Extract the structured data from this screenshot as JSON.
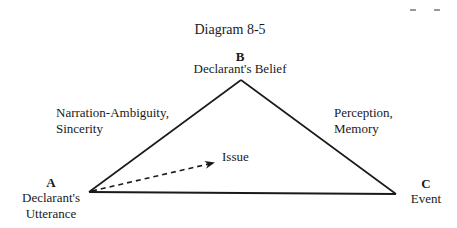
{
  "title": "Diagram 8-5",
  "vertices": {
    "A": {
      "letter": "A",
      "line1": "Declarant's",
      "line2": "Utterance"
    },
    "B": {
      "letter": "B",
      "line1": "Declarant's Belief"
    },
    "C": {
      "letter": "C",
      "line1": "Event"
    }
  },
  "edges": {
    "AB": {
      "line1": "Narration-Ambiguity,",
      "line2": "Sincerity"
    },
    "BC": {
      "line1": "Perception,",
      "line2": "Memory"
    }
  },
  "arrow": {
    "label": "Issue",
    "style": "dashed"
  },
  "colors": {
    "line": "#1a1a1a",
    "text": "#1a1a1a"
  }
}
